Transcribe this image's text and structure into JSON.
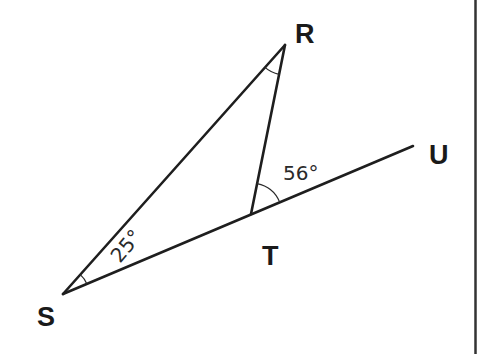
{
  "diagram": {
    "type": "geometry-triangle",
    "vertices": {
      "S": {
        "label": "S",
        "x": 63,
        "y": 294
      },
      "R": {
        "label": "R",
        "x": 285,
        "y": 45
      },
      "T": {
        "label": "T",
        "x": 251,
        "y": 214
      },
      "U": {
        "label": "U",
        "x": 413,
        "y": 146
      }
    },
    "segments": [
      {
        "from": "S",
        "to": "R"
      },
      {
        "from": "R",
        "to": "T"
      },
      {
        "from": "S",
        "to": "U"
      }
    ],
    "angles": {
      "S": {
        "label": "25°",
        "between": [
          "R",
          "T"
        ]
      },
      "RTU": {
        "label": "56°",
        "between": [
          "R",
          "U"
        ],
        "vertex": "T"
      },
      "R": {
        "label": "",
        "between": [
          "S",
          "T"
        ]
      }
    }
  },
  "labels": {
    "R": "R",
    "S": "S",
    "T": "T",
    "U": "U",
    "angle_S": "25°",
    "angle_RTU": "56°"
  },
  "colors": {
    "line": "#1e1e1e",
    "text": "#1a1a1a",
    "background": "#ffffff"
  }
}
